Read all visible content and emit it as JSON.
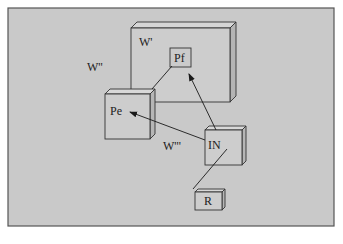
{
  "diagram": {
    "background_color": "#c9c9c9",
    "frame_color": "#555555",
    "line_color": "#1a1a1a",
    "region_labels": {
      "outer": "W''",
      "inner": "W'",
      "lower": "W'''"
    },
    "nodes": {
      "pf": "Pf",
      "pe": "Pe",
      "in": "IN",
      "r": "R"
    },
    "edges": [
      {
        "from": "IN",
        "to": "Pf",
        "type": "arrow"
      },
      {
        "from": "IN",
        "to": "Pe",
        "type": "arrow"
      },
      {
        "from": "Pe",
        "to": "Pf",
        "type": "line"
      },
      {
        "from": "IN",
        "to": "R",
        "type": "line"
      }
    ]
  }
}
